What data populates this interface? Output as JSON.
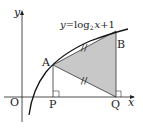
{
  "diagram": {
    "equation": {
      "prefix": "y",
      "equals": "=",
      "func": "log",
      "base": "2",
      "arg": "x",
      "suffix": "+1"
    },
    "axes": {
      "x_label": "x",
      "y_label": "y",
      "origin_label": "O"
    },
    "points": {
      "A": "A",
      "B": "B",
      "P": "P",
      "Q": "Q"
    },
    "shaded_region": "triangle ABQ",
    "equal_marks": [
      "AB",
      "AQ"
    ],
    "right_angles": [
      "P",
      "Q"
    ],
    "colors": {
      "shade": "#c8c8c8",
      "line": "#222222"
    }
  }
}
